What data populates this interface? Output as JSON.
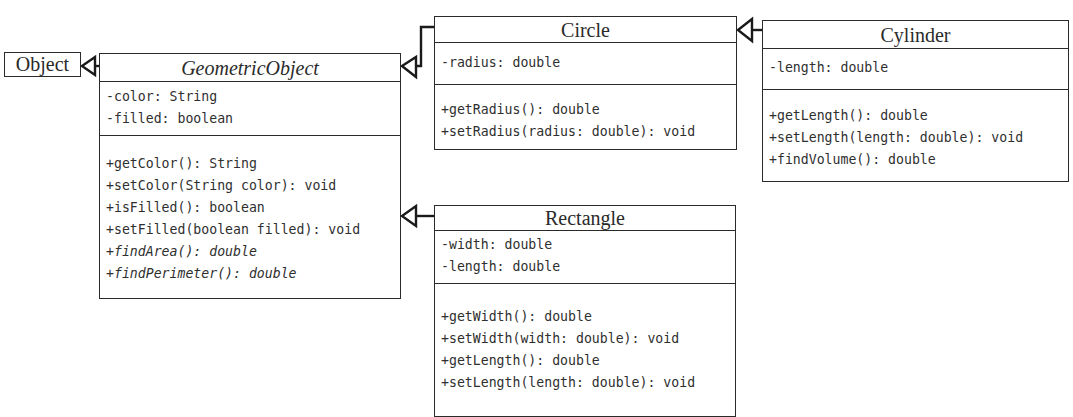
{
  "diagram": {
    "type": "uml-class-diagram",
    "classes": {
      "object": {
        "name": "Object"
      },
      "geometric_object": {
        "name": "GeometricObject",
        "abstract": true,
        "attributes": [
          "-color: String",
          "-filled: boolean"
        ],
        "methods": [
          {
            "text": "+getColor(): String",
            "abstract": false
          },
          {
            "text": "+setColor(String color): void",
            "abstract": false
          },
          {
            "text": "+isFilled(): boolean",
            "abstract": false
          },
          {
            "text": "+setFilled(boolean filled): void",
            "abstract": false
          },
          {
            "text": "+findArea(): double",
            "abstract": true
          },
          {
            "text": "+findPerimeter(): double",
            "abstract": true
          }
        ]
      },
      "circle": {
        "name": "Circle",
        "attributes": [
          "-radius: double"
        ],
        "methods": [
          {
            "text": "+getRadius(): double"
          },
          {
            "text": "+setRadius(radius: double): void"
          }
        ]
      },
      "cylinder": {
        "name": "Cylinder",
        "attributes": [
          "-length: double"
        ],
        "methods": [
          {
            "text": "+getLength(): double"
          },
          {
            "text": "+setLength(length: double): void"
          },
          {
            "text": "+findVolume(): double"
          }
        ]
      },
      "rectangle": {
        "name": "Rectangle",
        "attributes": [
          "-width: double",
          "-length: double"
        ],
        "methods": [
          {
            "text": "+getWidth(): double"
          },
          {
            "text": "+setWidth(width: double): void"
          },
          {
            "text": "+getLength(): double"
          },
          {
            "text": "+setLength(length: double): void"
          }
        ]
      }
    },
    "relationships": [
      {
        "type": "generalization",
        "from": "GeometricObject",
        "to": "Object"
      },
      {
        "type": "generalization",
        "from": "Circle",
        "to": "GeometricObject"
      },
      {
        "type": "generalization",
        "from": "Rectangle",
        "to": "GeometricObject"
      },
      {
        "type": "generalization",
        "from": "Cylinder",
        "to": "Circle"
      }
    ],
    "colors": {
      "line": "#2a2a2a",
      "text": "#2f2f2f",
      "background": "#ffffff"
    }
  }
}
